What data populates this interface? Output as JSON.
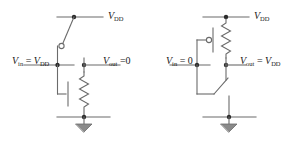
{
  "figure": {
    "background_color": "#ffffff",
    "wire_color": "#666666",
    "text_color": "#1a1a1a"
  },
  "circuits": [
    {
      "id": "left",
      "name": "input-high-state",
      "supply_label": {
        "symbol": "V",
        "sub": "DD"
      },
      "input_label": {
        "symbol": "V",
        "sub": "in",
        "op": " = ",
        "value_symbol": "V",
        "value_sub": "DD",
        "text": "Vin = VDD"
      },
      "output_label": {
        "symbol": "V",
        "sub": "out",
        "op": " =",
        "value": "0",
        "text": "Vout = 0"
      },
      "pmos": {
        "name": "pmos-switch",
        "state": "open",
        "has_bubble": true
      },
      "nmos": {
        "name": "nmos-switch",
        "state": "closed",
        "has_bubble": false
      },
      "resistor": {
        "name": "load-resistor",
        "position": "pull-down"
      },
      "ground": {
        "name": "ground-symbol"
      }
    },
    {
      "id": "right",
      "name": "input-low-state",
      "supply_label": {
        "symbol": "V",
        "sub": "DD"
      },
      "input_label": {
        "symbol": "V",
        "sub": "in",
        "op": " = ",
        "value": "0",
        "text": "Vin = 0"
      },
      "output_label": {
        "symbol": "V",
        "sub": "out",
        "op": " = ",
        "value_symbol": "V",
        "value_sub": "DD",
        "text": "Vout = VDD"
      },
      "pmos": {
        "name": "pmos-switch",
        "state": "closed",
        "has_bubble": true
      },
      "nmos": {
        "name": "nmos-switch",
        "state": "open",
        "has_bubble": false
      },
      "resistor": {
        "name": "load-resistor",
        "position": "pull-up"
      },
      "ground": {
        "name": "ground-symbol"
      }
    }
  ],
  "text": {
    "vdd_left": "V",
    "vdd_left_sub": "DD",
    "vdd_right": "V",
    "vdd_right_sub": "DD",
    "vin_left_v": "V",
    "vin_left_sub": "in",
    "vin_left_eq": " = ",
    "vin_left_val": "V",
    "vin_left_val_sub": "DD",
    "vout_left_v": "V",
    "vout_left_sub": "out",
    "vout_left_eq": " =",
    "vout_left_val": "0",
    "vin_right_v": "V",
    "vin_right_sub": "in",
    "vin_right_eq": " = ",
    "vin_right_val": "0",
    "vout_right_v": "V",
    "vout_right_sub": "out",
    "vout_right_eq": " = ",
    "vout_right_val": "V",
    "vout_right_val_sub": "DD"
  }
}
